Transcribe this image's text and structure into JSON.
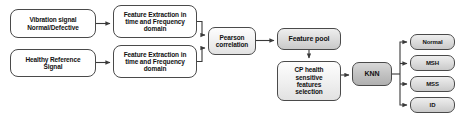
{
  "diagram": {
    "background_color": "#ffffff",
    "line_color": "#3a3a3a",
    "box_border_color": "#4a4a4a",
    "nodes": {
      "vibration_signal": "Vibration signal Normal/Defective",
      "vibration_signal_line1": "Vibration signal",
      "vibration_signal_line2": "Normal/Defective",
      "healthy_reference": "Healthy Reference Signal",
      "healthy_reference_line1": "Healthy Reference",
      "healthy_reference_line2": "Signal",
      "feature_extraction_top_line1": "Feature Extraction in",
      "feature_extraction_top_line2": "time and Frequency",
      "feature_extraction_top_line3": "domain",
      "feature_extraction_bottom_line1": "Feature Extraction in",
      "feature_extraction_bottom_line2": "time and Frequency",
      "feature_extraction_bottom_line3": "domain",
      "pearson_line1": "Pearson",
      "pearson_line2": "correlation",
      "feature_pool": "Feature pool",
      "cp_selection_line1": "CP health",
      "cp_selection_line2": "sensitive",
      "cp_selection_line3": "features",
      "cp_selection_line4": "selection",
      "classifier": "KNN"
    },
    "outputs": [
      {
        "label": "Normal"
      },
      {
        "label": "MSH"
      },
      {
        "label": "MSS"
      },
      {
        "label": "ID"
      }
    ]
  }
}
